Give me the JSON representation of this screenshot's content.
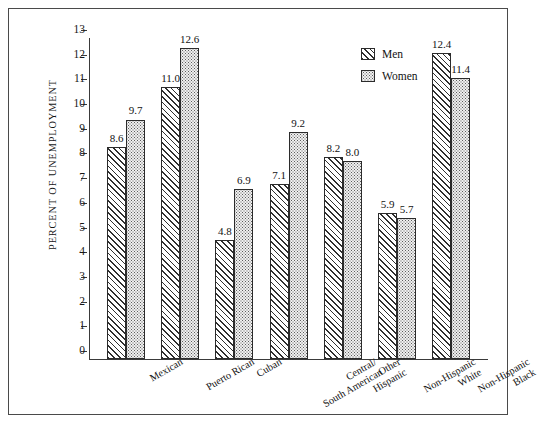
{
  "chart_data": {
    "type": "bar",
    "title": "",
    "xlabel": "",
    "ylabel": "PERCENT OF UNEMPLOYMENT",
    "ylim": [
      0,
      13
    ],
    "ytick_step": 1,
    "yticks": [
      "13",
      "12",
      "11",
      "10",
      "9",
      "8",
      "7",
      "6",
      "5",
      "4",
      "3",
      "2",
      "1",
      "0"
    ],
    "grid": false,
    "legend_position": "top-right",
    "categories": [
      "Mexican",
      "Puerto Rican",
      "Cuban",
      "Central/\nSouth American",
      "Other\nHispanic",
      "Non-Hispanic\nWhite",
      "Non-Hispanic\nBlack"
    ],
    "category_lines": [
      [
        "Mexican"
      ],
      [
        "Puerto Rican"
      ],
      [
        "Cuban"
      ],
      [
        "Central/",
        "South American"
      ],
      [
        "Other",
        "Hispanic"
      ],
      [
        "Non-Hispanic",
        "White"
      ],
      [
        "Non-Hispanic",
        "Black"
      ]
    ],
    "series": [
      {
        "name": "Men",
        "pattern": "diagonal-hatch",
        "values": [
          8.6,
          11.0,
          4.8,
          7.1,
          8.2,
          5.9,
          12.4
        ],
        "labels": [
          "8.6",
          "11.0",
          "4.8",
          "7.1",
          "8.2",
          "5.9",
          "12.4"
        ]
      },
      {
        "name": "Women",
        "pattern": "dotted-stipple",
        "values": [
          9.7,
          12.6,
          6.9,
          9.2,
          8.0,
          5.7,
          11.4
        ],
        "labels": [
          "9.7",
          "12.6",
          "6.9",
          "9.2",
          "8.0",
          "5.7",
          "11.4"
        ]
      }
    ]
  },
  "legend": {
    "entries": [
      {
        "label": "Men"
      },
      {
        "label": "Women"
      }
    ]
  },
  "colors": {
    "axis": "#3a3a3a",
    "frame": "#4a4a4a",
    "bar_outline": "#2b2b2b",
    "text": "#121212",
    "background": "#ffffff"
  }
}
